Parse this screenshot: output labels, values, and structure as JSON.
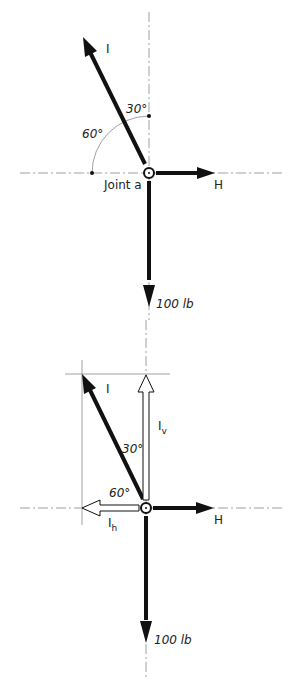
{
  "diagram_top": {
    "force_I_label": "I",
    "angle_from_vertical": "30°",
    "angle_from_horizontal": "60°",
    "joint_label": "Joint a",
    "force_H_label": "H",
    "load_label": "100 lb"
  },
  "diagram_bottom": {
    "force_I_label": "I",
    "component_vertical_label": "I",
    "component_vertical_sub": "v",
    "component_horizontal_label": "I",
    "component_horizontal_sub": "h",
    "angle_from_vertical": "30°",
    "angle_from_horizontal": "60°",
    "force_H_label": "H",
    "load_label": "100 lb"
  },
  "colors": {
    "ink": "#111111",
    "line": "#888888",
    "background": "#ffffff"
  }
}
